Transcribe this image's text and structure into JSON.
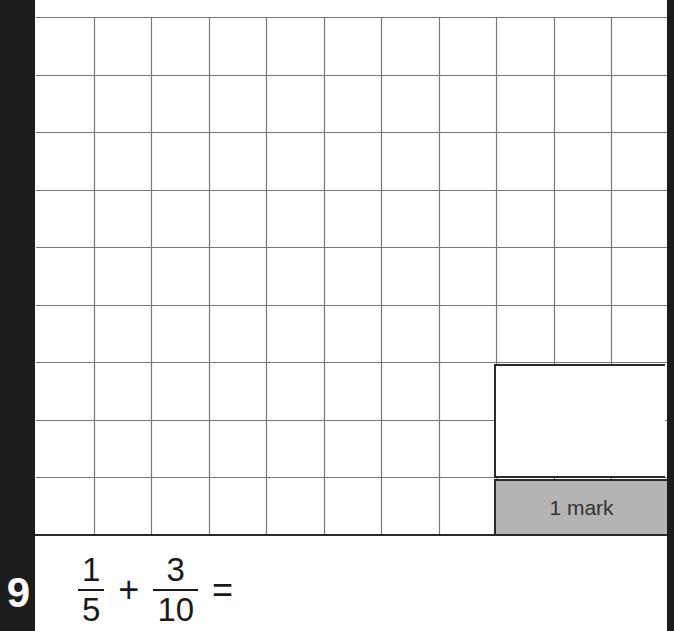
{
  "worksheet": {
    "grid": {
      "columns": 11,
      "rows": 9,
      "line_color": "#777777"
    },
    "answer_box": {
      "value": ""
    },
    "mark_box": {
      "label": "1 mark",
      "color": "#b4b4b4"
    },
    "question": {
      "number": "9",
      "expression": {
        "fraction1": {
          "numerator": "1",
          "denominator": "5"
        },
        "operator": "+",
        "fraction2": {
          "numerator": "3",
          "denominator": "10"
        },
        "equals": "="
      }
    }
  }
}
